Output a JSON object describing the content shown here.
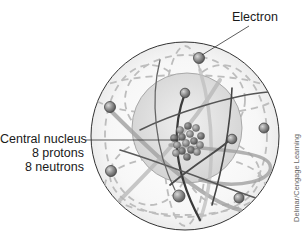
{
  "labels": {
    "electron": "Electron",
    "nucleus_line1": "Central nucleus",
    "nucleus_line2": "8 protons",
    "nucleus_line3": "8 neutrons"
  },
  "credit": "Delmar/Cengage Learning",
  "atom": {
    "element": "oxygen",
    "protons": 8,
    "neutrons": 8,
    "electrons": 8
  },
  "colors": {
    "electron_fill": "#8a8a8a",
    "outer_sphere_stroke": "#333333",
    "inner_sphere_fill": "#d9d9d9",
    "dashed_orbit": "#b5b5b5",
    "solid_orbit": "#555555",
    "ribbon_orbit": "#9a9a9a"
  }
}
